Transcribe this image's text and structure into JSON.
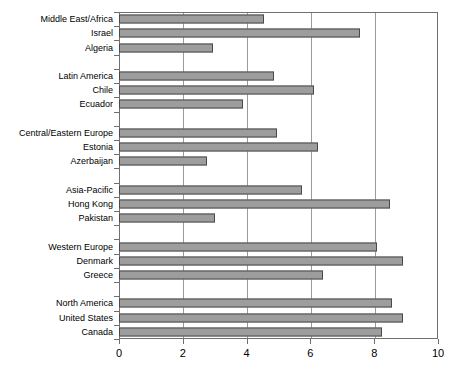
{
  "chart_data": {
    "type": "bar",
    "orientation": "horizontal",
    "title": "",
    "subtitle": "",
    "xlabel": "",
    "ylabel": "",
    "xlim": [
      0,
      10
    ],
    "ylim": null,
    "grid": true,
    "grid_axis": "x",
    "legend": false,
    "legend_position": "none",
    "xticks": [
      "0",
      "2",
      "4",
      "6",
      "8",
      "10"
    ],
    "xtick_values": [
      0,
      2,
      4,
      6,
      8,
      10
    ],
    "categories": [
      "Middle East/Africa",
      "Israel",
      "Algeria",
      "",
      "Latin America",
      "Chile",
      "Ecuador",
      "",
      "Central/Eastern Europe",
      "Estonia",
      "Azerbaijan",
      "",
      "Asia-Pacific",
      "Hong Kong",
      "Pakistan",
      "",
      "Western Europe",
      "Denmark",
      "Greece",
      "",
      "North America",
      "United States",
      "Canada"
    ],
    "values": [
      4.55,
      7.55,
      2.95,
      null,
      4.85,
      6.1,
      3.9,
      null,
      4.95,
      6.25,
      2.75,
      null,
      5.75,
      8.5,
      3.0,
      null,
      8.1,
      8.9,
      6.4,
      null,
      8.55,
      8.9,
      8.25
    ],
    "series": [
      {
        "name": "Score",
        "values": [
          4.55,
          7.55,
          2.95,
          null,
          4.85,
          6.1,
          3.9,
          null,
          4.95,
          6.25,
          2.75,
          null,
          5.75,
          8.5,
          3.0,
          null,
          8.1,
          8.9,
          6.4,
          null,
          8.55,
          8.9,
          8.25
        ],
        "color": "#9d9d9d"
      }
    ],
    "groups": [
      {
        "name": "Middle East/Africa",
        "members": [
          "Israel",
          "Algeria"
        ]
      },
      {
        "name": "Latin America",
        "members": [
          "Chile",
          "Ecuador"
        ]
      },
      {
        "name": "Central/Eastern Europe",
        "members": [
          "Estonia",
          "Azerbaijan"
        ]
      },
      {
        "name": "Asia-Pacific",
        "members": [
          "Hong Kong",
          "Pakistan"
        ]
      },
      {
        "name": "Western Europe",
        "members": [
          "Denmark",
          "Greece"
        ]
      },
      {
        "name": "North America",
        "members": [
          "United States",
          "Canada"
        ]
      }
    ]
  },
  "style": {
    "bar_fill": "#9d9d9d",
    "bar_border": "#4a4a4a",
    "grid_color": "#9a9a9a",
    "axis_color": "#6f6f6f",
    "background": "#ffffff",
    "text_color": "#000000"
  }
}
